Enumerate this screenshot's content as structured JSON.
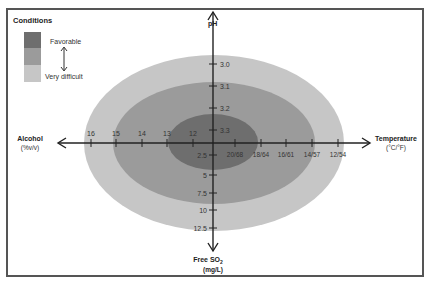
{
  "legend": {
    "title": "Conditions",
    "top_label": "Favorable",
    "bottom_label": "Very difficult",
    "colors": [
      "#6d6d6d",
      "#9a9a9a",
      "#c4c4c4"
    ]
  },
  "axes": {
    "up": {
      "label": "pH",
      "ticks": [
        "3.0",
        "3.1",
        "3.2",
        "3.3"
      ]
    },
    "left": {
      "label": "Alcohol",
      "unit": "(%v/v)",
      "ticks": [
        "16",
        "15",
        "14",
        "13",
        "12"
      ]
    },
    "right": {
      "label": "Temperature",
      "unit": "(°C/°F)",
      "ticks": [
        "20/68",
        "18/64",
        "16/61",
        "14/57",
        "12/54"
      ]
    },
    "down": {
      "label": "Free SO",
      "sub": "2",
      "unit": "(mg/L)",
      "ticks": [
        "2.5",
        "5",
        "7.5",
        "10",
        "12.5"
      ]
    }
  },
  "zones": [
    {
      "name": "very-difficult",
      "color": "#c4c4c4"
    },
    {
      "name": "intermediate",
      "color": "#9a9a9a"
    },
    {
      "name": "favorable",
      "color": "#6d6d6d"
    }
  ]
}
